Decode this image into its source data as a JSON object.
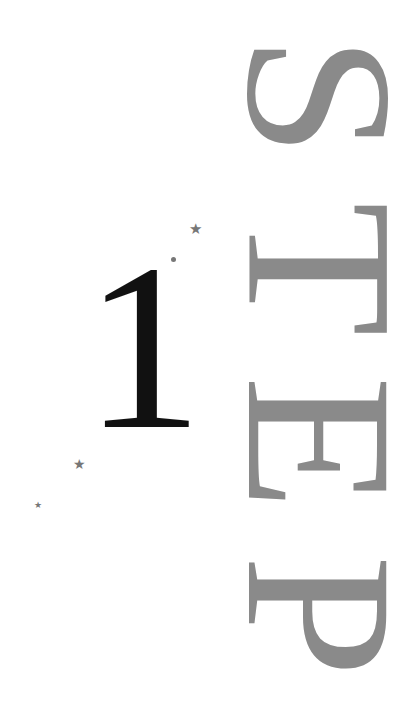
{
  "title": {
    "number": "1",
    "word_letters": [
      "S",
      "T",
      "E",
      "P"
    ],
    "word": "STEP",
    "orientation": "vertical, rotated 90deg clockwise"
  },
  "decorations": {
    "star_glyph": "★",
    "items": [
      {
        "type": "star",
        "x": 196,
        "y": 230,
        "size": 14
      },
      {
        "type": "dot",
        "x": 173,
        "y": 259,
        "size": 4
      },
      {
        "type": "star",
        "x": 80,
        "y": 465,
        "size": 13
      },
      {
        "type": "star",
        "x": 38,
        "y": 506,
        "size": 8
      }
    ]
  },
  "colors": {
    "background": "#ffffff",
    "number": "#111111",
    "word": "#8a8a8a",
    "stars": "#777777"
  }
}
